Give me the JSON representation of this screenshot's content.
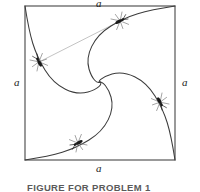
{
  "figure": {
    "caption": "FIGURE FOR PROBLEM 1",
    "side_labels": {
      "top": "a",
      "left": "a",
      "right": "a",
      "bottom": "a"
    },
    "colors": {
      "background": "#ffffff",
      "square_stroke": "#555555",
      "curve_stroke": "#3c3c3c",
      "pursuit_line": "#b4b4b4",
      "bug_body": "#1a1a1a",
      "bug_legs": "#8a8a8a",
      "caption_text": "#5a5a5a",
      "label_text": "#1a1a1a"
    },
    "square": {
      "left": 25,
      "top": 6,
      "right": 175,
      "bottom": 160,
      "side_length_label": "a"
    },
    "spiral_center": {
      "x": 100,
      "y": 82
    },
    "bug_count": 4,
    "bugs": [
      {
        "name": "bug-top",
        "x": 120,
        "y": 21,
        "rotation": -28
      },
      {
        "name": "bug-right",
        "x": 160,
        "y": 102,
        "rotation": 62
      },
      {
        "name": "bug-bottom",
        "x": 78,
        "y": 143,
        "rotation": 152
      },
      {
        "name": "bug-left",
        "x": 39,
        "y": 62,
        "rotation": 242
      }
    ],
    "pursuit_line": {
      "from": {
        "x": 39,
        "y": 62
      },
      "to": {
        "x": 120,
        "y": 21
      }
    }
  }
}
